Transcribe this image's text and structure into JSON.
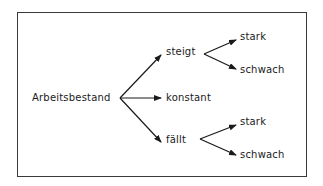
{
  "diagram": {
    "root": {
      "label": "Arbeitsbestand"
    },
    "level1": [
      {
        "label": "steigt"
      },
      {
        "label": "konstant"
      },
      {
        "label": "fällt"
      }
    ],
    "steigt_children": [
      {
        "label": "stark"
      },
      {
        "label": "schwach"
      }
    ],
    "faellt_children": [
      {
        "label": "stark"
      },
      {
        "label": "schwach"
      }
    ],
    "colors": {
      "line": "#1a1a1a",
      "border": "#3a3a3a",
      "background": "#ffffff"
    }
  }
}
